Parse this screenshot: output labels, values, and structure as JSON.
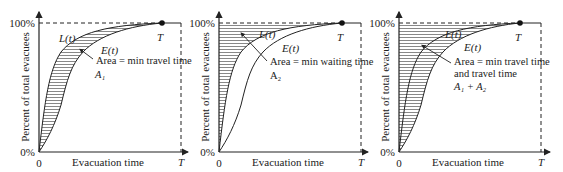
{
  "panels": [
    {
      "id": "panel-1",
      "y_axis_label": "Percent of total evacuees",
      "x_axis_label": "Evacuation time",
      "y_top_tick": "100%",
      "y_bottom_tick": "0%",
      "x_origin_tick": "0",
      "x_end_tick": "T",
      "end_point_label": "T",
      "curve_L_label": "L(t)",
      "curve_E_label": "E(t)",
      "annotation_line1": "Area = min travel time",
      "annotation_line2": "",
      "area_label": "A₁",
      "shaded_region": "between L(t) and E(t)"
    },
    {
      "id": "panel-2",
      "y_axis_label": "Percent of total evacuees",
      "x_axis_label": "Evacuation time",
      "y_top_tick": "100%",
      "y_bottom_tick": "0%",
      "x_origin_tick": "0",
      "x_end_tick": "T",
      "end_point_label": "T",
      "curve_L_label": "L(t)",
      "curve_E_label": "E(t)",
      "annotation_line1": "Area = min waiting time",
      "annotation_line2": "",
      "area_label": "A₂",
      "shaded_region": "between y-axis and L(t)"
    },
    {
      "id": "panel-3",
      "y_axis_label": "Percent of total evacuees",
      "x_axis_label": "Evacuation time",
      "y_top_tick": "100%",
      "y_bottom_tick": "0%",
      "x_origin_tick": "0",
      "x_end_tick": "T",
      "end_point_label": "T",
      "curve_L_label": "L(t)",
      "curve_E_label": "E(t)",
      "annotation_line1": "Area = min travel time",
      "annotation_line2": "and travel time",
      "area_label": "A₁ + A₂",
      "shaded_region": "between y-axis and E(t)"
    }
  ],
  "colors": {
    "line": "#222222",
    "hatch": "#444444",
    "background": "#ffffff"
  }
}
